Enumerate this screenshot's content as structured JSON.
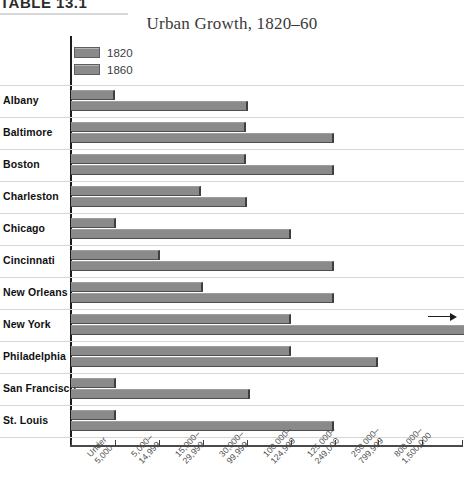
{
  "caption": {
    "label": "TABLE 13.1"
  },
  "title": "Urban Growth, 1820–60",
  "legend": {
    "items": [
      {
        "label": "1820",
        "color": "#8a8a8a"
      },
      {
        "label": "1860",
        "color": "#8a8a8a"
      }
    ]
  },
  "annotations": {
    "new_york_overflow": "arrow-right-icon"
  },
  "chart_data": {
    "type": "bar",
    "orientation": "horizontal",
    "title": "Urban Growth, 1820–60",
    "xlabel": "",
    "ylabel": "",
    "grid": true,
    "legend_position": "top-left",
    "categories": [
      "Albany",
      "Baltimore",
      "Boston",
      "Charleston",
      "Chicago",
      "Cincinnati",
      "New Orleans",
      "New York",
      "Philadelphia",
      "San Francisco",
      "St. Louis"
    ],
    "x_tick_labels": [
      "Under 5,000",
      "5,000–14,999",
      "15,000–29,999",
      "30,000–99,999",
      "100,000–124,999",
      "125,000–249,000",
      "250,000–799,999",
      "800,000–1,500,000"
    ],
    "x_tick_lines": [
      "Under",
      "5,000",
      "5,000–",
      "14,999",
      "15,000–",
      "29,999",
      "30,000–",
      "99,999",
      "100,000–",
      "124,999",
      "125,000–",
      "249,000",
      "250,000–",
      "799,999",
      "800,000–",
      "1,500,000"
    ],
    "series": [
      {
        "name": "1820",
        "bins": [
          "5,000–14,999",
          "30,000–99,999",
          "30,000–99,999",
          "15,000–29,999",
          "5,000–14,999",
          "15,000–29,999",
          "15,000–29,999",
          "100,000–124,999",
          "100,000–124,999",
          "5,000–14,999",
          "5,000–14,999"
        ],
        "values": [
          1,
          4,
          4,
          3,
          1,
          2,
          3,
          5,
          5,
          1,
          1
        ]
      },
      {
        "name": "1860",
        "bins": [
          "30,000–99,999",
          "125,000–249,000",
          "125,000–249,000",
          "30,000–99,999",
          "100,000–124,999",
          "125,000–249,000",
          "125,000–249,000",
          "800,000–1,500,000",
          "250,000–799,999",
          "30,000–99,999",
          "125,000–249,000"
        ],
        "values": [
          4,
          6,
          6,
          4,
          5,
          6,
          6,
          9,
          7,
          4,
          6
        ]
      }
    ],
    "rows": [
      {
        "city": "Albany",
        "v1820": 115,
        "v1860": 248,
        "overflow": false
      },
      {
        "city": "Baltimore",
        "v1820": 246,
        "v1860": 334,
        "overflow": false
      },
      {
        "city": "Boston",
        "v1820": 246,
        "v1860": 334,
        "overflow": false
      },
      {
        "city": "Charleston",
        "v1820": 201,
        "v1860": 247,
        "overflow": false
      },
      {
        "city": "Chicago",
        "v1820": 116,
        "v1860": 291,
        "overflow": false
      },
      {
        "city": "Cincinnati",
        "v1820": 160,
        "v1860": 334,
        "overflow": false
      },
      {
        "city": "New Orleans",
        "v1820": 203,
        "v1860": 334,
        "overflow": false
      },
      {
        "city": "New York",
        "v1820": 291,
        "v1860": 464,
        "overflow": true
      },
      {
        "city": "Philadelphia",
        "v1820": 291,
        "v1860": 378,
        "overflow": false
      },
      {
        "city": "San Francisco",
        "v1820": 116,
        "v1860": 250,
        "overflow": false
      },
      {
        "city": "St. Louis",
        "v1820": 116,
        "v1860": 334,
        "overflow": false
      }
    ]
  }
}
